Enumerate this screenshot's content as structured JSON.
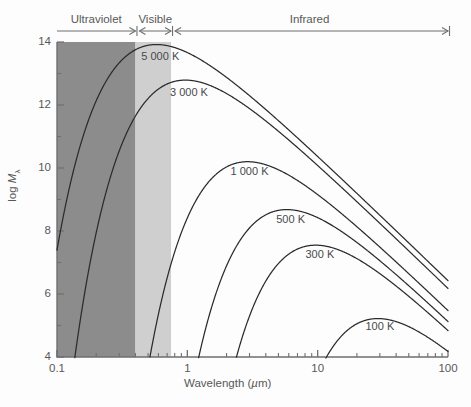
{
  "chart_data": {
    "type": "line",
    "title": "",
    "xlabel": "Wavelength (µm)",
    "ylabel": "log M",
    "ylabel_sub": "λ",
    "xscale": "log",
    "xlim": [
      0.1,
      100
    ],
    "ylim": [
      4,
      14
    ],
    "x_ticks": [
      {
        "value": 0.1,
        "label": "0.1"
      },
      {
        "value": 1,
        "label": "1"
      },
      {
        "value": 10,
        "label": "10"
      },
      {
        "value": 100,
        "label": "100"
      }
    ],
    "y_ticks": [
      {
        "value": 14,
        "label": "14"
      },
      {
        "value": 13,
        "label": ""
      },
      {
        "value": 12,
        "label": "12"
      },
      {
        "value": 11,
        "label": ""
      },
      {
        "value": 10,
        "label": "10"
      },
      {
        "value": 9,
        "label": ""
      },
      {
        "value": 8,
        "label": "8"
      },
      {
        "value": 7,
        "label": ""
      },
      {
        "value": 6,
        "label": "6"
      },
      {
        "value": 5,
        "label": ""
      },
      {
        "value": 4,
        "label": "4"
      }
    ],
    "grid": false,
    "legend": "inline-curve-labels",
    "series": [
      {
        "name": "5 000 K",
        "temperature_k": 5000,
        "peak_wavelength_um": 0.58,
        "peak_log_m": 13.92,
        "label_x_um": 0.62,
        "label_y": 13.5
      },
      {
        "name": "3 000 K",
        "temperature_k": 3000,
        "peak_wavelength_um": 0.97,
        "peak_log_m": 12.79,
        "label_x_um": 1.03,
        "label_y": 12.35
      },
      {
        "name": "1 000 K",
        "temperature_k": 1000,
        "peak_wavelength_um": 2.9,
        "peak_log_m": 10.2,
        "label_x_um": 3.0,
        "label_y": 9.83
      },
      {
        "name": "500 K",
        "temperature_k": 500,
        "peak_wavelength_um": 5.8,
        "peak_log_m": 8.68,
        "label_x_um": 6.2,
        "label_y": 8.32
      },
      {
        "name": "300 K",
        "temperature_k": 300,
        "peak_wavelength_um": 9.7,
        "peak_log_m": 7.55,
        "label_x_um": 10.4,
        "label_y": 7.2
      },
      {
        "name": "100 K",
        "temperature_k": 100,
        "peak_wavelength_um": 29,
        "peak_log_m": 5.22,
        "label_x_um": 30,
        "label_y": 4.92
      }
    ],
    "spectral_bands": [
      {
        "name": "Ultraviolet",
        "start_um": 0.1,
        "end_um": 0.4,
        "fill": "#8c8c8c"
      },
      {
        "name": "Visible",
        "start_um": 0.4,
        "end_um": 0.75,
        "fill": "#cfcfcf"
      },
      {
        "name": "Infrared",
        "start_um": 0.75,
        "end_um": 100,
        "fill": "none"
      }
    ]
  },
  "bands": {
    "ultraviolet": "Ultraviolet",
    "visible": "Visible",
    "infrared": "Infrared"
  },
  "axes": {
    "x_title": "Wavelength (",
    "x_title_unit": "µ",
    "x_title_end": "m)",
    "y_title": "log "
  },
  "colors": {
    "uv_band": "#8c8c8c",
    "visible_band": "#cfcfcf",
    "curve": "#2b2b2b",
    "axis": "#6f6f6f",
    "text": "#585858"
  }
}
